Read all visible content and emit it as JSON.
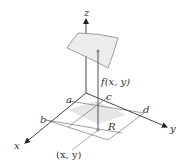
{
  "diagram": {
    "axes": {
      "x_label": "x",
      "y_label": "y",
      "z_label": "z"
    },
    "region": {
      "label": "R",
      "bounds_labels": {
        "a": "a",
        "b": "b",
        "c": "c",
        "d": "d"
      }
    },
    "point_label": "(x, y)",
    "height_label": "f(x, y)",
    "colors": {
      "axis": "#333333",
      "region_fill": "#e6e6e6",
      "surface_fill": "#ececec",
      "point": "#888888",
      "grid_line": "#777777"
    }
  }
}
